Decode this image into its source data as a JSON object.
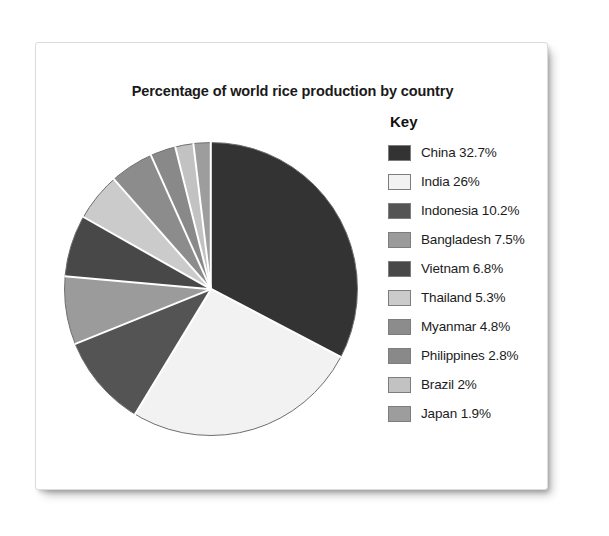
{
  "paper": {
    "background_color": "#ffffff"
  },
  "chart_data": {
    "type": "pie",
    "title": "Percentage of world rice production by country",
    "xlabel": "",
    "ylabel": "",
    "units": "percent",
    "start_angle_deg": 0,
    "direction": "clockwise",
    "legend_position": "right",
    "legend_title": "Key",
    "grid": false,
    "categories": [
      "China",
      "India",
      "Indonesia",
      "Bangladesh",
      "Vietnam",
      "Thailand",
      "Myanmar",
      "Philippines",
      "Brazil",
      "Japan"
    ],
    "values": [
      32.7,
      26,
      10.2,
      7.5,
      6.8,
      5.3,
      4.8,
      2.8,
      2,
      1.9
    ],
    "slice_colors": [
      "#333333",
      "#f2f2f2",
      "#545454",
      "#9b9b9b",
      "#484848",
      "#cbcbcb",
      "#8c8c8c",
      "#898989",
      "#c2c2c2",
      "#9d9d9d"
    ],
    "slices": [
      {
        "label": "China",
        "value": 32.7,
        "display": "China 32.7%",
        "color": "#333333"
      },
      {
        "label": "India",
        "value": 26,
        "display": "India 26%",
        "color": "#f2f2f2"
      },
      {
        "label": "Indonesia",
        "value": 10.2,
        "display": "Indonesia 10.2%",
        "color": "#545454"
      },
      {
        "label": "Bangladesh",
        "value": 7.5,
        "display": "Bangladesh 7.5%",
        "color": "#9b9b9b"
      },
      {
        "label": "Vietnam",
        "value": 6.8,
        "display": "Vietnam 6.8%",
        "color": "#484848"
      },
      {
        "label": "Thailand",
        "value": 5.3,
        "display": "Thailand 5.3%",
        "color": "#cbcbcb"
      },
      {
        "label": "Myanmar",
        "value": 4.8,
        "display": "Myanmar 4.8%",
        "color": "#8c8c8c"
      },
      {
        "label": "Philippines",
        "value": 2.8,
        "display": "Philippines 2.8%",
        "color": "#898989"
      },
      {
        "label": "Brazil",
        "value": 2,
        "display": "Brazil 2%",
        "color": "#c2c2c2"
      },
      {
        "label": "Japan",
        "value": 1.9,
        "display": "Japan 1.9%",
        "color": "#9d9d9d"
      }
    ]
  }
}
